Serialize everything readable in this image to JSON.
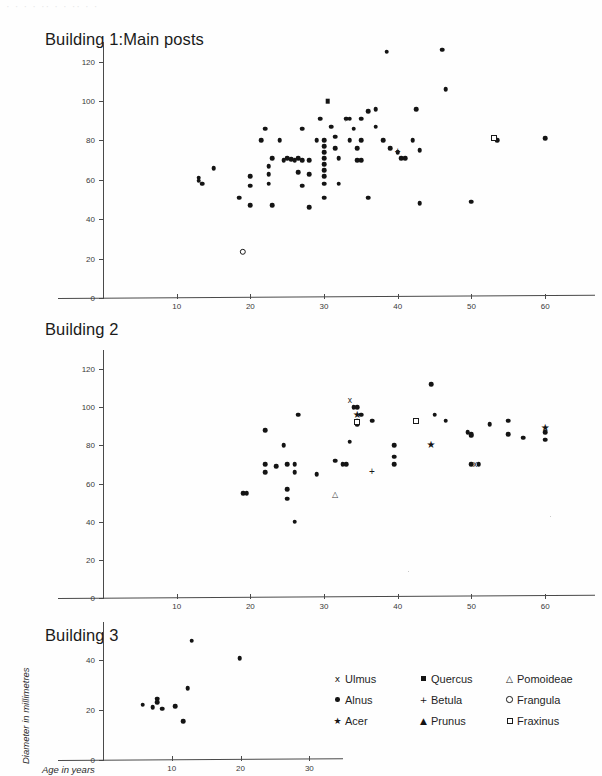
{
  "figure": {
    "top_cut_text": "· · ·   · ·· ·  ·   ·· · ·",
    "xlabel": "Age in years",
    "ylabel": "Diameter in millimetres",
    "ink_color": "#141414",
    "axis_color": "#4a4a4a"
  },
  "legend": {
    "rows": [
      [
        {
          "symbol": "x",
          "name": "Ulmus"
        },
        {
          "symbol": "filled-square",
          "name": "Quercus"
        },
        {
          "symbol": "open-triangle",
          "name": "Pomoideae"
        }
      ],
      [
        {
          "symbol": "filled-circle",
          "name": "Alnus"
        },
        {
          "symbol": "plus",
          "name": "Betula"
        },
        {
          "symbol": "open-circle",
          "name": "Frangula"
        }
      ],
      [
        {
          "symbol": "star",
          "name": "Acer"
        },
        {
          "symbol": "filled-triangle",
          "name": "Prunus"
        },
        {
          "symbol": "open-square",
          "name": "Fraxinus"
        }
      ]
    ]
  },
  "chart_data": [
    {
      "type": "scatter",
      "title": "Building 1:Main posts",
      "xlabel": "Age in years",
      "ylabel": "Diameter in millimetres",
      "xlim": [
        0,
        65
      ],
      "ylim": [
        0,
        130
      ],
      "xticks": [
        10,
        20,
        30,
        40,
        50,
        60
      ],
      "yticks": [
        0,
        20,
        40,
        60,
        80,
        100,
        120
      ],
      "grid": false,
      "series": [
        {
          "name": "Alnus",
          "marker": "filled-circle",
          "points": [
            [
              13,
              61
            ],
            [
              13,
              59.5
            ],
            [
              13.5,
              58
            ],
            [
              15,
              66
            ],
            [
              18.5,
              51
            ],
            [
              20,
              62
            ],
            [
              20,
              57
            ],
            [
              20,
              47
            ],
            [
              21.5,
              80
            ],
            [
              22,
              86
            ],
            [
              22.5,
              67
            ],
            [
              22.5,
              63
            ],
            [
              22.5,
              58
            ],
            [
              23,
              71
            ],
            [
              23,
              47
            ],
            [
              24,
              80
            ],
            [
              24.5,
              70
            ],
            [
              25,
              71
            ],
            [
              25.5,
              70.5
            ],
            [
              26,
              70
            ],
            [
              26.5,
              71
            ],
            [
              26.5,
              64
            ],
            [
              27,
              86
            ],
            [
              27,
              70
            ],
            [
              27,
              57
            ],
            [
              28,
              70
            ],
            [
              28,
              63
            ],
            [
              28,
              46
            ],
            [
              29,
              80
            ],
            [
              29.5,
              91
            ],
            [
              30,
              80
            ],
            [
              30,
              77
            ],
            [
              30,
              74
            ],
            [
              30,
              71
            ],
            [
              30,
              68
            ],
            [
              30,
              65
            ],
            [
              30,
              62
            ],
            [
              30,
              58
            ],
            [
              30,
              51
            ],
            [
              31,
              87
            ],
            [
              31.5,
              82
            ],
            [
              31.5,
              76
            ],
            [
              32,
              71
            ],
            [
              32,
              58
            ],
            [
              33,
              91
            ],
            [
              33.5,
              91
            ],
            [
              33.5,
              80
            ],
            [
              34,
              86
            ],
            [
              34.5,
              76
            ],
            [
              34.5,
              70
            ],
            [
              35,
              91
            ],
            [
              35,
              80
            ],
            [
              35,
              70
            ],
            [
              36,
              95
            ],
            [
              36,
              51
            ],
            [
              37,
              96
            ],
            [
              37,
              87
            ],
            [
              38,
              80
            ],
            [
              38.5,
              125
            ],
            [
              39,
              76
            ],
            [
              40,
              74
            ],
            [
              40.5,
              71
            ],
            [
              41,
              71
            ],
            [
              42,
              80
            ],
            [
              42.5,
              96
            ],
            [
              43,
              75
            ],
            [
              43,
              48
            ],
            [
              46,
              126
            ],
            [
              46.5,
              106
            ],
            [
              50,
              49
            ],
            [
              53.5,
              80
            ],
            [
              60,
              81
            ]
          ]
        },
        {
          "name": "Quercus",
          "marker": "filled-square",
          "points": [
            [
              30.5,
              100
            ]
          ]
        },
        {
          "name": "Betula",
          "marker": "plus",
          "points": [
            [
              40,
              74
            ]
          ]
        },
        {
          "name": "Frangula",
          "marker": "open-circle",
          "points": [
            [
              19,
              23.5
            ]
          ]
        },
        {
          "name": "Fraxinus",
          "marker": "open-square",
          "points": [
            [
              53,
              81
            ]
          ]
        }
      ]
    },
    {
      "type": "scatter",
      "title": "Building 2",
      "xlabel": "Age in years",
      "ylabel": "Diameter in millimetres",
      "xlim": [
        0,
        65
      ],
      "ylim": [
        0,
        130
      ],
      "xticks": [
        10,
        20,
        30,
        40,
        50,
        60
      ],
      "yticks": [
        0,
        20,
        40,
        60,
        80,
        100,
        120
      ],
      "grid": false,
      "series": [
        {
          "name": "Alnus",
          "marker": "filled-circle",
          "points": [
            [
              19,
              55
            ],
            [
              19.5,
              55
            ],
            [
              22,
              88
            ],
            [
              22,
              70
            ],
            [
              22,
              66
            ],
            [
              23.5,
              69
            ],
            [
              24.5,
              80
            ],
            [
              25,
              70
            ],
            [
              25,
              57
            ],
            [
              25,
              52
            ],
            [
              26,
              70
            ],
            [
              26,
              66
            ],
            [
              26,
              40
            ],
            [
              26.5,
              96
            ],
            [
              29,
              65
            ],
            [
              31.5,
              72
            ],
            [
              32.5,
              70
            ],
            [
              33,
              70
            ],
            [
              33.5,
              82
            ],
            [
              34,
              100
            ],
            [
              34.5,
              100
            ],
            [
              34.5,
              93
            ],
            [
              34.5,
              91
            ],
            [
              35,
              96
            ],
            [
              36.5,
              93
            ],
            [
              39.5,
              80
            ],
            [
              39.5,
              74
            ],
            [
              39.5,
              70
            ],
            [
              44.5,
              112
            ],
            [
              45,
              96
            ],
            [
              46.5,
              93
            ],
            [
              49.5,
              87
            ],
            [
              50,
              70
            ],
            [
              50,
              85
            ],
            [
              50,
              86
            ],
            [
              51,
              70
            ],
            [
              52.5,
              91
            ],
            [
              55,
              93
            ],
            [
              55,
              86
            ],
            [
              57,
              84
            ],
            [
              60,
              87
            ],
            [
              60,
              83
            ]
          ]
        },
        {
          "name": "Ulmus",
          "marker": "x",
          "points": [
            [
              33.5,
              104
            ],
            [
              50.5,
              70
            ]
          ]
        },
        {
          "name": "Acer",
          "marker": "star",
          "points": [
            [
              34.5,
              96
            ],
            [
              44.5,
              80
            ],
            [
              60,
              89
            ]
          ]
        },
        {
          "name": "Fraxinus",
          "marker": "open-square",
          "points": [
            [
              34.5,
              92
            ],
            [
              42.5,
              93
            ]
          ]
        },
        {
          "name": "Betula",
          "marker": "plus",
          "points": [
            [
              36.5,
              66
            ]
          ]
        },
        {
          "name": "Pomoideae",
          "marker": "open-triangle",
          "points": [
            [
              31.5,
              54
            ]
          ]
        }
      ]
    },
    {
      "type": "scatter",
      "title": "Building 3",
      "xlabel": "Age in years",
      "ylabel": "Diameter in millimetres",
      "xlim": [
        0,
        33
      ],
      "ylim": [
        0,
        55
      ],
      "xticks": [
        10,
        20,
        30
      ],
      "yticks": [
        0,
        20,
        40
      ],
      "grid": false,
      "series": [
        {
          "name": "Alnus",
          "marker": "filled-circle",
          "points": [
            [
              5.8,
              22
            ],
            [
              7.2,
              21
            ],
            [
              7.9,
              24.5
            ],
            [
              7.9,
              23
            ],
            [
              8.6,
              20.5
            ],
            [
              10.5,
              21.5
            ],
            [
              11.7,
              15.5
            ],
            [
              12.3,
              28.5
            ],
            [
              12.9,
              47.5
            ],
            [
              19.9,
              40.5
            ]
          ]
        }
      ]
    }
  ]
}
